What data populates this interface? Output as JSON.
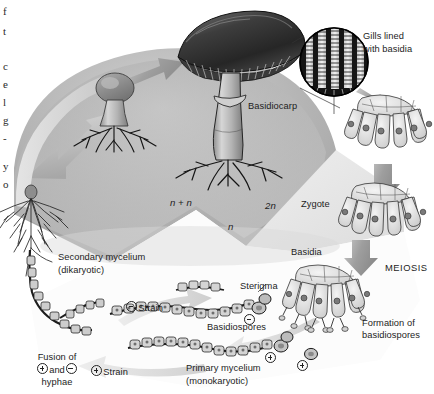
{
  "figure": {
    "type": "biological-life-cycle-diagram",
    "background_color": "#ffffff"
  },
  "ploidy_zones": [
    {
      "id": "dikaryotic",
      "label": "n + n",
      "color": "#b4b4b4",
      "italic": true
    },
    {
      "id": "diploid",
      "label": "2n",
      "color": "#e4e4e4",
      "italic": true
    },
    {
      "id": "haploid",
      "label": "n",
      "color": "#fdfdfd",
      "italic": true
    }
  ],
  "labels": {
    "basidiocarp": "Basidiocarp",
    "gills_lined": "Gills lined",
    "with_basidia": "with basidia",
    "zygote": "Zygote",
    "basidia": "Basidia",
    "meiosis": "MEIOSIS",
    "formation_of": "Formation of",
    "basidiospores_2": "basidiospores",
    "secondary_mycelium": "Secondary mycelium",
    "dikaryotic": "(dikaryotic)",
    "sterigma": "Sterigma",
    "basidiospores": "Basidiospores",
    "minus_strain": "Strain",
    "plus_strain": "Strain",
    "primary_mycelium": "Primary mycelium",
    "monokaryotic": "(monokaryotic)",
    "fusion_of": "Fusion of",
    "fusion_and": "and",
    "fusion_hyphae": "hyphae"
  },
  "bleed_letters": [
    "f",
    "t",
    "c",
    "e",
    "l",
    "g",
    "-",
    "y",
    "o"
  ],
  "structures": [
    {
      "name": "button-mushroom-young",
      "stage": "young basidiocarp primordium"
    },
    {
      "name": "mushroom-basidiocarp",
      "stage": "mature basidiocarp (fruiting body)"
    },
    {
      "name": "gill-closeup-circle",
      "stage": "magnified gill cross-section"
    },
    {
      "name": "basidium-cluster-zygote",
      "stage": "basidia with diploid zygote nuclei"
    },
    {
      "name": "basidium-cluster-meiosis",
      "stage": "basidia undergoing meiosis"
    },
    {
      "name": "basidium-cluster-spores",
      "stage": "basidia forming basidiospores"
    },
    {
      "name": "secondary-mycelium-tuft",
      "stage": "dikaryotic secondary mycelium"
    },
    {
      "name": "hyphae-plus-strain",
      "stage": "monokaryotic + hypha"
    },
    {
      "name": "hyphae-minus-strain",
      "stage": "monokaryotic - hypha"
    },
    {
      "name": "basidiospore-pair-minus",
      "stage": "germinating - basidiospores"
    },
    {
      "name": "basidiospore-pair-plus",
      "stage": "germinating + basidiospores"
    }
  ]
}
